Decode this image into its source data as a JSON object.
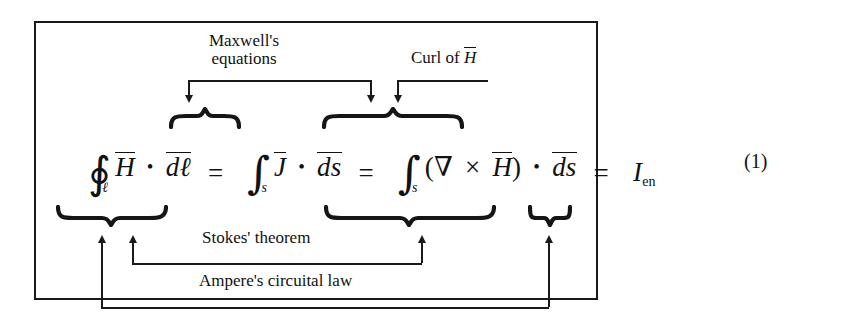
{
  "figure": {
    "equation_number": "(1)",
    "equation_plain": "∮_ℓ H̄ • d̄ℓ̄ = ∫_s J̄ • d̄s̄ = ∫_s (∇ × H̄) • d̄s̄ = I_en",
    "equation": {
      "term1": {
        "integral_glyph": "∮",
        "integral_subscript": "ℓ",
        "field": "H",
        "dot": "•",
        "differential": "dℓ"
      },
      "equals1": "=",
      "term2": {
        "integral_glyph": "∫",
        "integral_subscript": "s",
        "field": "J",
        "dot": "•",
        "differential": "ds"
      },
      "equals2": "=",
      "term3": {
        "integral_glyph": "∫",
        "integral_subscript": "s",
        "open_paren": "(",
        "nabla": "∇",
        "times": "×",
        "field": "H",
        "close_paren": ")",
        "dot": "•",
        "differential": "ds"
      },
      "equals3": "=",
      "term4": {
        "symbol": "I",
        "subscript": "en"
      }
    },
    "annotations": {
      "maxwell": {
        "line1": "Maxwell's",
        "line2": "equations"
      },
      "curl": {
        "text_prefix": "Curl of ",
        "field": "H"
      },
      "stokes": "Stokes' theorem",
      "ampere": "Ampere's circuital law"
    },
    "colors": {
      "ink": "#111111",
      "border": "#1a1a1a",
      "background": "#ffffff"
    }
  }
}
